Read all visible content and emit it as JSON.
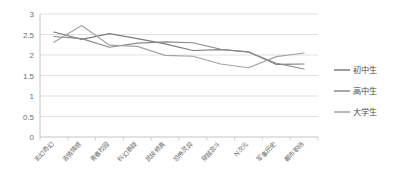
{
  "chart_data": {
    "type": "line",
    "title": "",
    "xlabel": "",
    "ylabel": "",
    "ylim": [
      0,
      3
    ],
    "ytick_values": [
      0,
      0.5,
      1,
      1.5,
      2,
      2.5,
      3
    ],
    "ytick_labels": [
      "0",
      "0.5",
      "1",
      "1.5",
      "2",
      "2.5",
      "3"
    ],
    "grid": true,
    "legend_position": "right",
    "categories": [
      "玄幻奇幻",
      "言情情感",
      "青春校园",
      "科幻悬疑",
      "武侠修真",
      "恐怖灵异",
      "穿越宫斗",
      "N次元",
      "军事历史",
      "都市职场"
    ],
    "series": [
      {
        "name": "初中生",
        "color": "#7d7d7d",
        "values": [
          2.56,
          2.38,
          2.52,
          2.4,
          2.27,
          2.11,
          2.13,
          2.08,
          1.77,
          1.78
        ]
      },
      {
        "name": "高中生",
        "color": "#8a8a8a",
        "values": [
          2.45,
          2.4,
          2.19,
          2.29,
          2.32,
          2.3,
          2.14,
          2.07,
          1.8,
          1.66
        ]
      },
      {
        "name": "大学生",
        "color": "#a3a3a3",
        "values": [
          2.31,
          2.72,
          2.24,
          2.21,
          1.99,
          1.97,
          1.78,
          1.69,
          1.96,
          2.05
        ]
      }
    ]
  },
  "legend": {
    "entries": [
      {
        "label": "初中生"
      },
      {
        "label": "高中生"
      },
      {
        "label": "大学生"
      }
    ]
  }
}
